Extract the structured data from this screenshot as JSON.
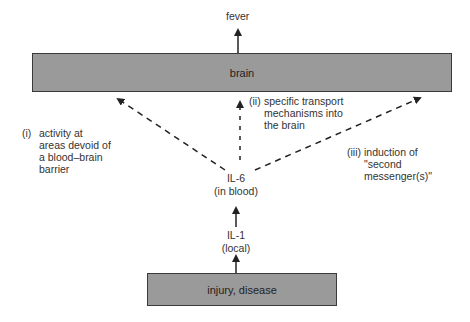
{
  "nodes": {
    "fever": "fever",
    "brain": "brain",
    "il6_line1": "IL-6",
    "il6_line2": "(in blood)",
    "il1_line1": "IL-1",
    "il1_line2": "(local)",
    "injury": "injury, disease"
  },
  "pathways": {
    "i": {
      "num": "(i)",
      "lines": [
        "activity at",
        "areas devoid of",
        "a blood–brain",
        "barrier"
      ]
    },
    "ii": {
      "num": "(ii)",
      "lines": [
        "specific transport",
        "mechanisms into",
        "the brain"
      ]
    },
    "iii": {
      "num": "(iii)",
      "lines": [
        "induction of",
        "\"second",
        "messenger(s)\""
      ]
    }
  },
  "colors": {
    "box_fill": "#9a9a9a",
    "box_border": "#3a3a3a",
    "line": "#222222"
  }
}
